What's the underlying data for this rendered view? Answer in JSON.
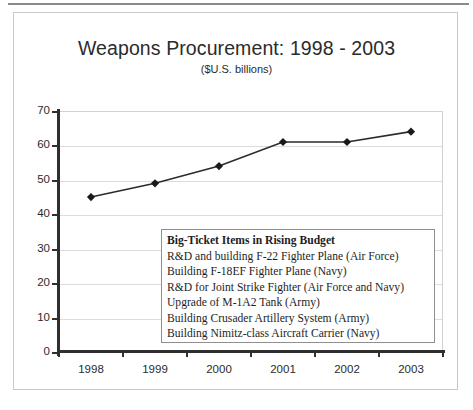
{
  "chart_data": {
    "type": "line",
    "title": "Weapons Procurement: 1998 - 2003",
    "subtitle": "($U.S. billions)",
    "xlabel": "",
    "ylabel": "",
    "categories": [
      "1998",
      "1999",
      "2000",
      "2001",
      "2002",
      "2003"
    ],
    "values": [
      45,
      49,
      54,
      61,
      61,
      64
    ],
    "series": [
      {
        "name": "Weapons Procurement",
        "values": [
          45,
          49,
          54,
          61,
          61,
          64
        ]
      }
    ],
    "ylim": [
      0,
      70
    ],
    "y_ticks": [
      0,
      10,
      20,
      30,
      40,
      50,
      60,
      70
    ],
    "y_tick_labels": [
      "0",
      "10",
      "20",
      "30",
      "40",
      "50",
      "60",
      "70"
    ],
    "grid": true,
    "legend_position": "inside-center",
    "marker": "diamond",
    "line_color": "#2b2b2b",
    "marker_color": "#1a1a1a",
    "grid_color": "#dcdcdc",
    "axis_color": "#2f2f2f"
  },
  "callout": {
    "header": "Big-Ticket Items in Rising Budget",
    "items": [
      "R&D and building F-22 Fighter Plane (Air Force)",
      "Building F-18EF Fighter Plane (Navy)",
      "R&D for Joint Strike Fighter (Air Force and Navy)",
      "Upgrade of M-1A2 Tank (Army)",
      "Building Crusader Artillery System (Army)",
      "Building Nimitz-class Aircraft Carrier (Navy)"
    ]
  }
}
